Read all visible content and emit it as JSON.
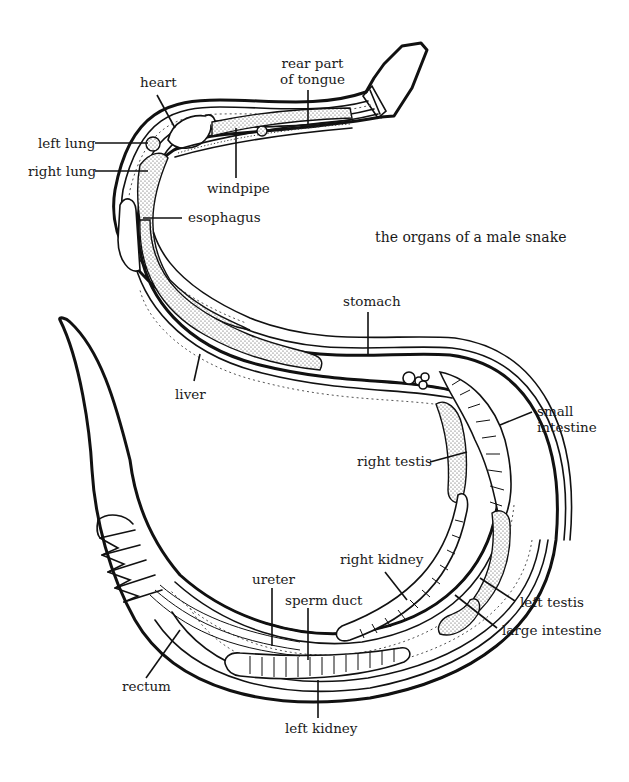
{
  "title": "the organs of a male snake",
  "colors": {
    "ink": "#111111",
    "background": "#ffffff",
    "stipple": "#555555"
  },
  "labels": {
    "heart": "heart",
    "rear_tongue_line1": "rear part",
    "rear_tongue_line2": "of tongue",
    "left_lung": "left lung",
    "right_lung": "right lung",
    "windpipe": "windpipe",
    "esophagus": "esophagus",
    "stomach": "stomach",
    "liver": "liver",
    "small_intestine_line1": "small",
    "small_intestine_line2": "intestine",
    "right_testis": "right testis",
    "right_kidney": "right kidney",
    "ureter": "ureter",
    "sperm_duct": "sperm duct",
    "left_testis": "left testis",
    "large_intestine": "large intestine",
    "rectum": "rectum",
    "left_kidney": "left kidney"
  }
}
